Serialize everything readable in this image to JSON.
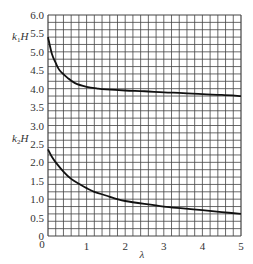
{
  "chart_data": {
    "type": "line",
    "title": "",
    "xlabel": "λ",
    "ylabel_upper": "k1H",
    "ylabel_lower": "k2H",
    "xlim": [
      0,
      5
    ],
    "ylim": [
      0,
      6
    ],
    "grid": true,
    "grid_step_x": 0.2,
    "grid_step_y": 0.2,
    "x_ticks": [
      "1",
      "2",
      "3",
      "4",
      "5"
    ],
    "y_ticks": [
      "0",
      "0.5",
      "1.0",
      "1.5",
      "2.0",
      "2.5",
      "3.0",
      "3.5",
      "4.0",
      "4.5",
      "5.0",
      "5.5",
      "6.0"
    ],
    "origin_label": "0",
    "series": [
      {
        "name": "k1H",
        "x": [
          0,
          0.1,
          0.2,
          0.3,
          0.5,
          0.7,
          1.0,
          1.3,
          1.5,
          2.0,
          2.5,
          3.0,
          3.5,
          4.0,
          4.5,
          5.0
        ],
        "values": [
          5.4,
          4.95,
          4.7,
          4.5,
          4.3,
          4.15,
          4.05,
          4.0,
          3.98,
          3.95,
          3.93,
          3.9,
          3.88,
          3.85,
          3.83,
          3.8
        ]
      },
      {
        "name": "k2H",
        "x": [
          0,
          0.1,
          0.2,
          0.4,
          0.6,
          0.8,
          1.0,
          1.2,
          1.5,
          1.8,
          2.0,
          2.5,
          3.0,
          3.5,
          4.0,
          4.5,
          5.0
        ],
        "values": [
          2.35,
          2.15,
          2.0,
          1.75,
          1.55,
          1.42,
          1.3,
          1.2,
          1.1,
          1.0,
          0.95,
          0.87,
          0.8,
          0.75,
          0.7,
          0.65,
          0.6
        ]
      }
    ]
  },
  "labels": {
    "upper_main": "k",
    "upper_sub": "1",
    "upper_tail": "H",
    "lower_main": "k",
    "lower_sub": "2",
    "lower_tail": "H",
    "xlabel": "λ"
  }
}
